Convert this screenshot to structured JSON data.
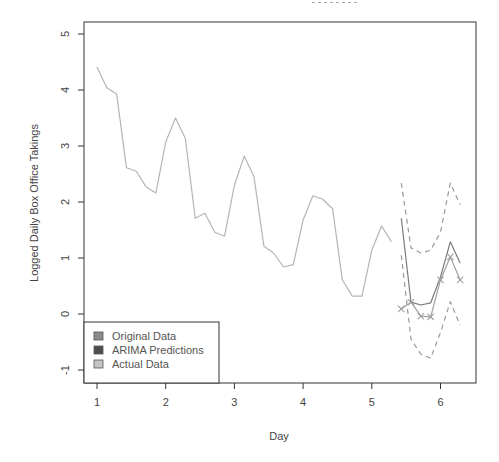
{
  "chart_data": {
    "type": "line",
    "title": "",
    "xlabel": "Day",
    "ylabel": "Logged Daily Box Office Takings",
    "xlim": [
      1,
      6.33
    ],
    "ylim": [
      -1.25,
      5.2
    ],
    "x_ticks": [
      1,
      2,
      3,
      4,
      5,
      6
    ],
    "y_ticks": [
      -1,
      0,
      1,
      2,
      3,
      4,
      5
    ],
    "grid": false,
    "legend_position": "bottomleft",
    "legend": [
      {
        "label": "Original Data",
        "color": "#8c8c8c"
      },
      {
        "label": "ARIMA Predictions",
        "color": "#4d4d4d"
      },
      {
        "label": "Actual Data",
        "color": "#c4c4c4"
      }
    ],
    "series": [
      {
        "name": "Original Data",
        "style": "solid",
        "color": "#b5b5b5",
        "x": [
          1.0,
          1.143,
          1.286,
          1.429,
          1.571,
          1.714,
          1.857,
          2.0,
          2.143,
          2.286,
          2.429,
          2.571,
          2.714,
          2.857,
          3.0,
          3.143,
          3.286,
          3.429,
          3.571,
          3.714,
          3.857,
          4.0,
          4.143,
          4.286,
          4.429,
          4.571,
          4.714,
          4.857,
          5.0,
          5.143,
          5.286
        ],
        "values": [
          4.41,
          4.04,
          3.93,
          2.61,
          2.55,
          2.27,
          2.16,
          3.07,
          3.5,
          3.14,
          1.71,
          1.8,
          1.46,
          1.39,
          2.3,
          2.82,
          2.45,
          1.21,
          1.09,
          0.84,
          0.88,
          1.68,
          2.11,
          2.05,
          1.88,
          0.61,
          0.32,
          0.32,
          1.14,
          1.57,
          1.29
        ]
      },
      {
        "name": "ARIMA Predictions",
        "style": "solid",
        "color": "#7a7a7a",
        "x": [
          5.429,
          5.571,
          5.714,
          5.857,
          6.0,
          6.143,
          6.286
        ],
        "values": [
          1.71,
          0.21,
          0.16,
          0.2,
          0.66,
          1.29,
          0.91
        ]
      },
      {
        "name": "Upper Prediction Interval",
        "style": "dashed",
        "color": "#9a9a9a",
        "x": [
          5.429,
          5.571,
          5.714,
          5.857,
          6.0,
          6.143,
          6.286
        ],
        "values": [
          2.34,
          1.18,
          1.09,
          1.14,
          1.46,
          2.34,
          1.95
        ]
      },
      {
        "name": "Lower Prediction Interval",
        "style": "dashed",
        "color": "#9a9a9a",
        "x": [
          5.429,
          5.571,
          5.714,
          5.857,
          6.0,
          6.143,
          6.286
        ],
        "values": [
          1.05,
          -0.45,
          -0.72,
          -0.79,
          -0.33,
          0.22,
          -0.2
        ]
      },
      {
        "name": "Actual Data",
        "style": "line+x-markers",
        "color": "#a0a0a0",
        "x": [
          5.429,
          5.571,
          5.714,
          5.857,
          6.0,
          6.143,
          6.286
        ],
        "values": [
          0.09,
          0.21,
          -0.04,
          -0.05,
          0.61,
          1.02,
          0.61
        ]
      }
    ]
  },
  "layout": {
    "plot_box": {
      "left": 84,
      "top": 22,
      "right": 476,
      "bottom": 383
    },
    "x_map": {
      "px_at_1": 97,
      "px_per_unit": 68.7
    },
    "y_map": {
      "px_at_0": 314,
      "px_per_unit": 56
    },
    "legend_box": {
      "left": 84,
      "top": 322,
      "right": 219,
      "bottom": 383
    }
  }
}
